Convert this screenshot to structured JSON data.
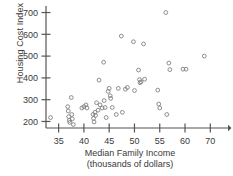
{
  "chart_data": {
    "type": "scatter",
    "title": "",
    "xlabel": "Median Family Income",
    "xlabel_sub": "(thousands of dollars)",
    "ylabel": "Housing Cost Index",
    "xlim": [
      32.5,
      68.5
    ],
    "ylim": [
      170,
      730
    ],
    "xticks": [
      35,
      40,
      45,
      50,
      55,
      60,
      65
    ],
    "xticklabels": [
      "35",
      "40",
      "45",
      "50",
      "55",
      "60",
      "70"
    ],
    "yticks": [
      200,
      300,
      400,
      500,
      600,
      700
    ],
    "yticklabels": [
      "200",
      "300",
      "400",
      "500",
      "600",
      "700"
    ],
    "grid": false,
    "legend": null,
    "marker": "open-circle",
    "marker_color": "#808080",
    "axis_color": "#555555",
    "points": [
      {
        "x": 33.4,
        "y": 218
      },
      {
        "x": 36.8,
        "y": 268
      },
      {
        "x": 36.9,
        "y": 248
      },
      {
        "x": 37.0,
        "y": 222
      },
      {
        "x": 37.1,
        "y": 205
      },
      {
        "x": 37.2,
        "y": 196
      },
      {
        "x": 37.5,
        "y": 310
      },
      {
        "x": 37.6,
        "y": 232
      },
      {
        "x": 37.7,
        "y": 212
      },
      {
        "x": 37.9,
        "y": 186
      },
      {
        "x": 39.6,
        "y": 262
      },
      {
        "x": 40.0,
        "y": 268
      },
      {
        "x": 40.4,
        "y": 276
      },
      {
        "x": 40.6,
        "y": 262
      },
      {
        "x": 41.8,
        "y": 232
      },
      {
        "x": 41.9,
        "y": 214
      },
      {
        "x": 42.0,
        "y": 198
      },
      {
        "x": 42.2,
        "y": 242
      },
      {
        "x": 42.3,
        "y": 228
      },
      {
        "x": 42.5,
        "y": 286
      },
      {
        "x": 42.8,
        "y": 252
      },
      {
        "x": 43.0,
        "y": 390
      },
      {
        "x": 43.2,
        "y": 276
      },
      {
        "x": 43.6,
        "y": 262
      },
      {
        "x": 43.9,
        "y": 472
      },
      {
        "x": 44.0,
        "y": 296
      },
      {
        "x": 44.2,
        "y": 264
      },
      {
        "x": 44.4,
        "y": 218
      },
      {
        "x": 44.8,
        "y": 338
      },
      {
        "x": 45.0,
        "y": 352
      },
      {
        "x": 45.2,
        "y": 318
      },
      {
        "x": 45.3,
        "y": 306
      },
      {
        "x": 45.6,
        "y": 264
      },
      {
        "x": 46.4,
        "y": 232
      },
      {
        "x": 46.8,
        "y": 352
      },
      {
        "x": 47.4,
        "y": 592
      },
      {
        "x": 47.6,
        "y": 242
      },
      {
        "x": 48.2,
        "y": 348
      },
      {
        "x": 48.6,
        "y": 356
      },
      {
        "x": 49.8,
        "y": 566
      },
      {
        "x": 50.0,
        "y": 342
      },
      {
        "x": 50.8,
        "y": 436
      },
      {
        "x": 51.0,
        "y": 392
      },
      {
        "x": 51.1,
        "y": 378
      },
      {
        "x": 51.3,
        "y": 382
      },
      {
        "x": 51.8,
        "y": 556
      },
      {
        "x": 52.0,
        "y": 394
      },
      {
        "x": 54.6,
        "y": 344
      },
      {
        "x": 54.8,
        "y": 280
      },
      {
        "x": 55.0,
        "y": 262
      },
      {
        "x": 56.2,
        "y": 700
      },
      {
        "x": 56.4,
        "y": 232
      },
      {
        "x": 56.8,
        "y": 468
      },
      {
        "x": 57.0,
        "y": 438
      },
      {
        "x": 59.6,
        "y": 440
      },
      {
        "x": 60.2,
        "y": 440
      },
      {
        "x": 63.8,
        "y": 500
      }
    ]
  }
}
